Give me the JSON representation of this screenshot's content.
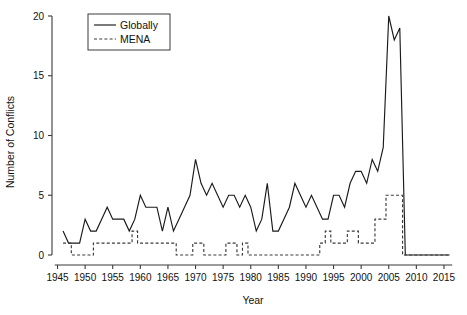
{
  "chart_data": {
    "type": "line",
    "title": "",
    "xlabel": "Year",
    "ylabel": "Number of Conflicts",
    "xlim": [
      1944,
      2017
    ],
    "ylim": [
      0,
      20
    ],
    "grid": false,
    "legend_position": "top-left",
    "xticks": [
      "1945",
      "1950",
      "1955",
      "1960",
      "1965",
      "1970",
      "1975",
      "1980",
      "1985",
      "1990",
      "1995",
      "2000",
      "2005",
      "2010",
      "2015"
    ],
    "yticks": [
      "0",
      "5",
      "10",
      "15",
      "20"
    ],
    "x": [
      1946,
      1947,
      1948,
      1949,
      1950,
      1951,
      1952,
      1953,
      1954,
      1955,
      1956,
      1957,
      1958,
      1959,
      1960,
      1961,
      1962,
      1963,
      1964,
      1965,
      1966,
      1967,
      1968,
      1969,
      1970,
      1971,
      1972,
      1973,
      1974,
      1975,
      1976,
      1977,
      1978,
      1979,
      1980,
      1981,
      1982,
      1983,
      1984,
      1985,
      1986,
      1987,
      1988,
      1989,
      1990,
      1991,
      1992,
      1993,
      1994,
      1995,
      1996,
      1997,
      1998,
      1999,
      2000,
      2001,
      2002,
      2003,
      2004,
      2005,
      2006,
      2007,
      2008,
      2009,
      2010,
      2011,
      2012,
      2013,
      2014,
      2015,
      2016
    ],
    "series": [
      {
        "name": "Globally",
        "style": "solid",
        "color": "#1a1a1a",
        "values": [
          2,
          1,
          1,
          1,
          3,
          2,
          2,
          3,
          4,
          3,
          3,
          3,
          2,
          3,
          5,
          4,
          4,
          4,
          2,
          4,
          2,
          3,
          4,
          5,
          8,
          6,
          5,
          6,
          5,
          4,
          5,
          5,
          4,
          5,
          4,
          2,
          3,
          6,
          2,
          2,
          3,
          4,
          6,
          5,
          4,
          5,
          4,
          3,
          3,
          5,
          5,
          4,
          6,
          7,
          7,
          6,
          8,
          7,
          9,
          20,
          18,
          19,
          0,
          0,
          0,
          0,
          0,
          0,
          0,
          0,
          0
        ]
      },
      {
        "name": "MENA",
        "style": "dashed",
        "color": "#3a3a3a",
        "values": [
          1,
          1,
          0,
          0,
          0,
          0,
          1,
          1,
          1,
          1,
          1,
          1,
          1,
          2,
          1,
          1,
          1,
          1,
          1,
          1,
          1,
          0,
          0,
          0,
          1,
          1,
          0,
          0,
          0,
          0,
          1,
          1,
          0,
          1,
          0,
          0,
          0,
          0,
          0,
          0,
          0,
          0,
          0,
          0,
          0,
          0,
          0,
          1,
          2,
          1,
          1,
          1,
          2,
          2,
          1,
          1,
          1,
          3,
          3,
          5,
          5,
          5,
          0,
          0,
          0,
          0,
          0,
          0,
          0,
          0,
          0
        ]
      }
    ]
  },
  "legend": {
    "entries": [
      {
        "label": "Globally",
        "style": "solid"
      },
      {
        "label": "MENA",
        "style": "dashed"
      }
    ]
  },
  "axes": {
    "x_title": "Year",
    "y_title": "Number of Conflicts"
  }
}
